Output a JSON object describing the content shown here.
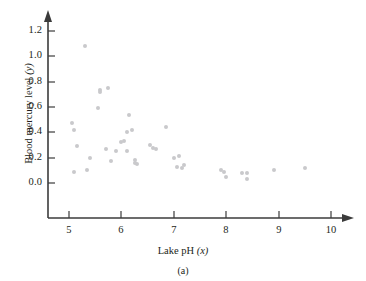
{
  "figure": {
    "caption": "(a)",
    "marker_color": "#c9c9cc",
    "axis_color": "#3b3b3b"
  },
  "chart_data": {
    "type": "scatter",
    "title": "",
    "xlabel": "Lake pH (x)",
    "xlabel_text": "Lake pH",
    "xlabel_var": "(x)",
    "ylabel": "Blood mercury level (y)",
    "ylabel_text": "Blood mercury level",
    "ylabel_var": "(y)",
    "xlim": [
      4.6,
      10.35
    ],
    "ylim": [
      -0.09,
      1.3
    ],
    "xticks": [
      5,
      6,
      7,
      8,
      9,
      10
    ],
    "xtick_labels": [
      "5",
      "6",
      "7",
      "8",
      "9",
      "10"
    ],
    "yticks": [
      0.0,
      0.2,
      0.4,
      0.6,
      0.8,
      1.0,
      1.2
    ],
    "ytick_labels": [
      "0.0",
      "0.2",
      "0.4",
      "0.6",
      "0.8",
      "1.0",
      "1.2"
    ],
    "grid": false,
    "legend": false,
    "x": [
      5.05,
      5.1,
      5.1,
      5.15,
      5.3,
      5.35,
      5.4,
      5.55,
      5.6,
      5.6,
      5.7,
      5.75,
      5.8,
      5.9,
      6.0,
      6.05,
      6.1,
      6.1,
      6.15,
      6.2,
      6.25,
      6.25,
      6.3,
      6.55,
      6.6,
      6.65,
      6.85,
      7.0,
      7.05,
      7.1,
      7.15,
      7.2,
      7.9,
      7.95,
      8.0,
      8.3,
      8.4,
      8.4,
      8.9,
      9.5
    ],
    "y": [
      0.47,
      0.42,
      0.09,
      0.29,
      1.08,
      0.1,
      0.2,
      0.59,
      0.73,
      0.72,
      0.27,
      0.75,
      0.17,
      0.25,
      0.32,
      0.33,
      0.4,
      0.25,
      0.54,
      0.42,
      0.18,
      0.16,
      0.15,
      0.3,
      0.28,
      0.27,
      0.44,
      0.2,
      0.13,
      0.21,
      0.12,
      0.14,
      0.1,
      0.09,
      0.05,
      0.08,
      0.08,
      0.03,
      0.1,
      0.12
    ],
    "n_points": 40
  }
}
